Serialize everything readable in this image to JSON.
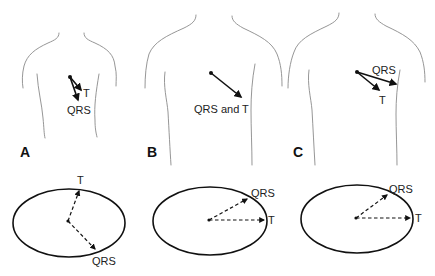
{
  "panels": [
    {
      "id": "A",
      "label": "A",
      "torso_vectors": [
        {
          "name": "T",
          "label": "T"
        },
        {
          "name": "QRS",
          "label": "QRS"
        }
      ],
      "loop_vectors": [
        {
          "name": "T",
          "label": "T"
        },
        {
          "name": "QRS",
          "label": "QRS"
        }
      ]
    },
    {
      "id": "B",
      "label": "B",
      "torso_vectors": [
        {
          "name": "QRS and T",
          "label": "QRS and T"
        }
      ],
      "loop_vectors": [
        {
          "name": "QRS",
          "label": "QRS"
        },
        {
          "name": "T",
          "label": "T"
        }
      ]
    },
    {
      "id": "C",
      "label": "C",
      "torso_vectors": [
        {
          "name": "QRS",
          "label": "QRS"
        },
        {
          "name": "T",
          "label": "T"
        }
      ],
      "loop_vectors": [
        {
          "name": "QRS",
          "label": "QRS"
        },
        {
          "name": "T",
          "label": "T"
        }
      ]
    }
  ],
  "colors": {
    "outline": "#8a8a8a",
    "vector": "#111111",
    "background": "#ffffff"
  }
}
